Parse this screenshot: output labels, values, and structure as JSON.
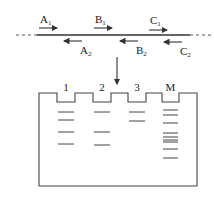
{
  "primers": {
    "forward": [
      {
        "letter": "A",
        "sub": "1",
        "x": 40,
        "label_y": 23,
        "arrow_y": 28
      },
      {
        "letter": "B",
        "sub": "1",
        "x": 95,
        "label_y": 23,
        "arrow_y": 28
      },
      {
        "letter": "C",
        "sub": "1",
        "x": 150,
        "label_y": 24,
        "arrow_y": 30
      }
    ],
    "reverse": [
      {
        "letter": "A",
        "sub": "2",
        "x": 80,
        "label_y": 54,
        "arrow_y": 41
      },
      {
        "letter": "B",
        "sub": "2",
        "x": 136,
        "label_y": 54,
        "arrow_y": 41
      },
      {
        "letter": "C",
        "sub": "2",
        "x": 180,
        "label_y": 55,
        "arrow_y": 42
      }
    ]
  },
  "gel": {
    "lanes": [
      {
        "label": "1",
        "x0": 57,
        "x1": 75,
        "bands": [
          112,
          120,
          132,
          144
        ]
      },
      {
        "label": "2",
        "x0": 93,
        "x1": 111,
        "bands": [
          112,
          132,
          145
        ]
      },
      {
        "label": "3",
        "x0": 128,
        "x1": 146,
        "bands": [
          112,
          121
        ]
      },
      {
        "label": "M",
        "x0": 162,
        "x1": 179,
        "bands": [
          110,
          115,
          123,
          133,
          137,
          140,
          142,
          149,
          158
        ]
      }
    ]
  },
  "colors": {
    "line": "#333333",
    "background": "#ffffff"
  }
}
